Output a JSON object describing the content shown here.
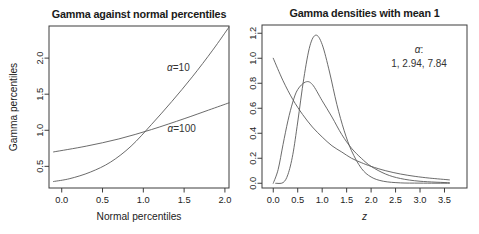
{
  "figure": {
    "width": 479,
    "height": 234,
    "background": "#ffffff",
    "axis_color": "#3d3d3d",
    "curve_color": "#5a5a5a",
    "text_color": "#1a1a1a"
  },
  "chart_data": [
    {
      "type": "line",
      "title": "Gamma against normal percentiles",
      "xlabel": "Normal percentiles",
      "xlabel_italic": false,
      "ylabel": "Gamma percentiles",
      "xlim": [
        -0.156,
        2.05
      ],
      "ylim": [
        0.2,
        2.445
      ],
      "grid": false,
      "legend_position": "none",
      "xticks": {
        "values": [
          0,
          0.5,
          1.0,
          1.5,
          2.0
        ],
        "labels": [
          "0.0",
          "0.5",
          "1.0",
          "1.5",
          "2.0"
        ]
      },
      "yticks": {
        "values": [
          0.5,
          1.0,
          1.5,
          2.0
        ],
        "labels": [
          "0.5",
          "1.0",
          "1.5",
          "2.0"
        ]
      },
      "series": [
        {
          "name": "alpha-10",
          "label": "α=10",
          "label_pos": [
            1.43,
            1.87
          ],
          "points": [
            [
              -0.1,
              0.29
            ],
            [
              0.1,
              0.33
            ],
            [
              0.35,
              0.42
            ],
            [
              0.6,
              0.56
            ],
            [
              0.85,
              0.78
            ],
            [
              1.1,
              1.08
            ],
            [
              1.35,
              1.4
            ],
            [
              1.6,
              1.74
            ],
            [
              1.85,
              2.11
            ],
            [
              2.05,
              2.43
            ]
          ]
        },
        {
          "name": "alpha-100",
          "label": "α=100",
          "label_pos": [
            1.47,
            1.03
          ],
          "points": [
            [
              -0.1,
              0.7
            ],
            [
              0.3,
              0.78
            ],
            [
              0.7,
              0.88
            ],
            [
              1.1,
              1.01
            ],
            [
              1.5,
              1.16
            ],
            [
              1.8,
              1.28
            ],
            [
              2.05,
              1.38
            ]
          ]
        }
      ],
      "annotations": []
    },
    {
      "type": "line",
      "title": "Gamma densities with mean 1",
      "xlabel": "z",
      "xlabel_italic": true,
      "ylabel": "",
      "xlim": [
        -0.23,
        3.96
      ],
      "ylim": [
        -0.038,
        1.266
      ],
      "grid": false,
      "legend_position": "inside-top-right",
      "xticks": {
        "values": [
          0,
          0.5,
          1.0,
          1.5,
          2.0,
          2.5,
          3.0,
          3.5
        ],
        "labels": [
          "0.0",
          "0.5",
          "1.0",
          "1.5",
          "2.0",
          "2.5",
          "3.0",
          "3.5"
        ]
      },
      "yticks": {
        "values": [
          0,
          0.2,
          0.4,
          0.6,
          0.8,
          1.0,
          1.2
        ],
        "labels": [
          "0.0",
          "0.2",
          "0.4",
          "0.6",
          "0.8",
          "1.0",
          "1.2"
        ]
      },
      "series": [
        {
          "name": "alpha-1",
          "label": "",
          "label_pos": null,
          "points": [
            [
              0,
              1.0
            ],
            [
              0.2,
              0.82
            ],
            [
              0.4,
              0.67
            ],
            [
              0.6,
              0.55
            ],
            [
              0.8,
              0.45
            ],
            [
              1.0,
              0.37
            ],
            [
              1.2,
              0.3
            ],
            [
              1.4,
              0.25
            ],
            [
              1.6,
              0.2
            ],
            [
              1.8,
              0.165
            ],
            [
              2.0,
              0.135
            ],
            [
              2.3,
              0.1
            ],
            [
              2.6,
              0.074
            ],
            [
              2.9,
              0.055
            ],
            [
              3.2,
              0.041
            ],
            [
              3.6,
              0.027
            ]
          ]
        },
        {
          "name": "alpha-2.94",
          "label": "",
          "label_pos": null,
          "points": [
            [
              0,
              0.0
            ],
            [
              0.1,
              0.11
            ],
            [
              0.2,
              0.31
            ],
            [
              0.3,
              0.5
            ],
            [
              0.4,
              0.65
            ],
            [
              0.5,
              0.75
            ],
            [
              0.66,
              0.81
            ],
            [
              0.8,
              0.79
            ],
            [
              1.0,
              0.66
            ],
            [
              1.2,
              0.53
            ],
            [
              1.4,
              0.39
            ],
            [
              1.6,
              0.28
            ],
            [
              1.8,
              0.2
            ],
            [
              2.0,
              0.135
            ],
            [
              2.3,
              0.073
            ],
            [
              2.6,
              0.038
            ],
            [
              3.0,
              0.016
            ],
            [
              3.6,
              0.004
            ]
          ]
        },
        {
          "name": "alpha-7.84",
          "label": "",
          "label_pos": null,
          "points": [
            [
              0.05,
              0.0
            ],
            [
              0.2,
              0.005
            ],
            [
              0.3,
              0.07
            ],
            [
              0.4,
              0.23
            ],
            [
              0.5,
              0.49
            ],
            [
              0.625,
              0.84
            ],
            [
              0.75,
              1.1
            ],
            [
              0.872,
              1.185
            ],
            [
              1.0,
              1.11
            ],
            [
              1.15,
              0.89
            ],
            [
              1.3,
              0.63
            ],
            [
              1.45,
              0.42
            ],
            [
              1.6,
              0.26
            ],
            [
              1.8,
              0.12
            ],
            [
              2.0,
              0.05
            ],
            [
              2.25,
              0.016
            ],
            [
              2.6,
              0.003
            ],
            [
              3.0,
              0.001
            ],
            [
              3.6,
              0.0
            ]
          ]
        }
      ],
      "annotations": [
        {
          "text": "α:",
          "x": 2.98,
          "y": 1.07
        },
        {
          "text": "1, 2.94, 7.84",
          "x": 2.98,
          "y": 0.955
        }
      ]
    }
  ]
}
